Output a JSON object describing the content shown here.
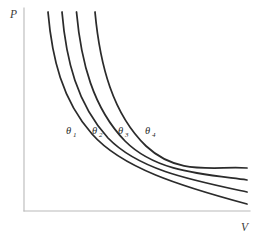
{
  "figure": {
    "background_color": "#ffffff",
    "curve_color": "#2b2b2b",
    "axis_color": "#b9b9b9",
    "label_color": "#2b2b2b"
  },
  "axes": {
    "y_axis_label": "P",
    "x_axis_label": "V",
    "y_axis_name": "pressure",
    "x_axis_name": "volume",
    "ticks": [],
    "gridlines": false
  },
  "chart_data": {
    "type": "line",
    "xlabel": "V",
    "ylabel": "P",
    "xlim": [
      0,
      1
    ],
    "ylim": [
      0,
      1
    ],
    "grid": false,
    "legend_position": "inline-on-curve",
    "axis_ticks_shown": false,
    "series": [
      {
        "name": "θ₁",
        "label_base": "θ",
        "label_subscript": "1",
        "constant_k": 0.062,
        "label_x": 72,
        "label_y": 133,
        "x": [
          0.107,
          0.118,
          0.133,
          0.155,
          0.186,
          0.23,
          0.292,
          0.372,
          0.465,
          0.566,
          0.672,
          0.78,
          0.89,
          1.0
        ],
        "y": [
          0.99,
          0.905,
          0.81,
          0.7,
          0.585,
          0.475,
          0.375,
          0.295,
          0.236,
          0.195,
          0.165,
          0.143,
          0.126,
          0.113
        ]
      },
      {
        "name": "θ₂",
        "label_base": "θ",
        "label_subscript": "2",
        "constant_k": 0.079,
        "label_x": 98,
        "label_y": 133,
        "x": [
          0.168,
          0.18,
          0.197,
          0.222,
          0.256,
          0.303,
          0.366,
          0.444,
          0.533,
          0.63,
          0.73,
          0.83,
          0.92,
          1.0
        ],
        "y": [
          0.99,
          0.91,
          0.825,
          0.725,
          0.622,
          0.52,
          0.425,
          0.345,
          0.285,
          0.24,
          0.206,
          0.18,
          0.162,
          0.148
        ]
      },
      {
        "name": "θ₃",
        "label_base": "θ",
        "label_subscript": "3",
        "constant_k": 0.098,
        "label_x": 124,
        "label_y": 133,
        "x": [
          0.23,
          0.243,
          0.262,
          0.289,
          0.325,
          0.374,
          0.437,
          0.514,
          0.6,
          0.692,
          0.786,
          0.878,
          0.945,
          1.0
        ],
        "y": [
          0.99,
          0.915,
          0.84,
          0.748,
          0.652,
          0.556,
          0.466,
          0.388,
          0.325,
          0.277,
          0.24,
          0.212,
          0.196,
          0.184
        ]
      },
      {
        "name": "θ₄",
        "label_base": "θ",
        "label_subscript": "4",
        "constant_k": 0.12,
        "label_x": 151,
        "label_y": 133,
        "x": [
          0.314,
          0.328,
          0.348,
          0.376,
          0.414,
          0.464,
          0.526,
          0.6,
          0.682,
          0.768,
          0.852,
          0.92,
          0.965,
          1.0
        ],
        "y": [
          0.99,
          0.92,
          0.85,
          0.765,
          0.675,
          0.583,
          0.494,
          0.415,
          0.35,
          0.299,
          0.259,
          0.233,
          0.22,
          0.21
        ]
      }
    ],
    "annotations": [
      {
        "text": "θ₁",
        "x": 72,
        "y": 133
      },
      {
        "text": "θ₂",
        "x": 98,
        "y": 133
      },
      {
        "text": "θ₃",
        "x": 124,
        "y": 133
      },
      {
        "text": "θ₄",
        "x": 151,
        "y": 133
      }
    ]
  },
  "geometry": {
    "y_axis_path": "M 24 8 L 24 211",
    "x_axis_path": "M 24 211 L 250 211",
    "curve_paths": [
      "M 48 12 C 52 58, 62 100, 92 134 C 122 168, 180 186, 247 204",
      "M 62 12 C 66 60, 77 104, 108 138 C 139 170, 191 180, 247 192",
      "M 76.5 12 C 81 62, 93 108, 125 141 C 156 172, 202 174, 247 180",
      "M 95 12 C 100 66, 113 114, 146 146 C 178 176, 213 166, 247 168"
    ],
    "y_axis_label_pos": {
      "x": 10,
      "y": 18
    },
    "x_axis_label_pos": {
      "x": 241,
      "y": 231
    }
  }
}
